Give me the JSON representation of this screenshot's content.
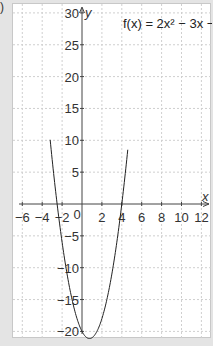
{
  "part_label": ")",
  "chart_data": {
    "type": "line",
    "title": "f(x) = 2x² − 3x − 20",
    "function": {
      "a": 2,
      "b": -3,
      "c": -20
    },
    "xlabel": "x",
    "ylabel": "y",
    "xlim": [
      -7,
      13
    ],
    "ylim": [
      -21.5,
      31
    ],
    "x_ticks": [
      -6,
      -4,
      -2,
      0,
      2,
      4,
      6,
      8,
      10,
      12
    ],
    "x_tick_labels": [
      "−6",
      "−4",
      "−2",
      "0",
      "2",
      "4",
      "6",
      "8",
      "10",
      "12"
    ],
    "y_ticks": [
      30,
      25,
      20,
      15,
      10,
      5,
      -5,
      -10,
      -15,
      -20
    ],
    "y_tick_labels": [
      "30",
      "25",
      "20",
      "15",
      "10",
      "5",
      "−5",
      "−10",
      "−15",
      "−20"
    ],
    "grid": true,
    "grid_style": "dashed",
    "series": [
      {
        "name": "f(x) = 2x² − 3x − 20",
        "x_range": [
          -3.2,
          4.6
        ],
        "vertex": [
          0.75,
          -21.125
        ],
        "roots": [
          -2.5,
          4
        ]
      }
    ]
  }
}
